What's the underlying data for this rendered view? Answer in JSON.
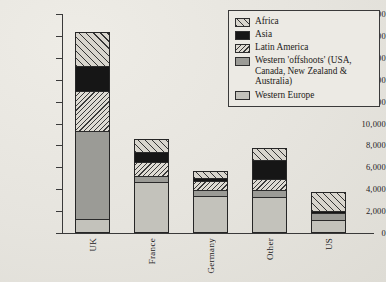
{
  "chart_data": {
    "type": "bar",
    "subtype": "stacked-vertical",
    "title": "",
    "xlabel": "",
    "ylabel": "",
    "ylim": [
      0,
      20000
    ],
    "ytick_step": 2000,
    "ytick_labels": [
      "20,000",
      "18,000",
      "16,000",
      "14,000",
      "12,000",
      "10,000",
      "8,000",
      "6,000",
      "4,000",
      "2,000",
      "0"
    ],
    "ytick_values": [
      20000,
      18000,
      16000,
      14000,
      12000,
      10000,
      8000,
      6000,
      4000,
      2000,
      0
    ],
    "grid": false,
    "legend_position": "top-right",
    "categories": [
      "UK",
      "France",
      "Germany",
      "Other",
      "US"
    ],
    "series": [
      {
        "name": "Western Europe",
        "fill": "solid-light-gray",
        "color": "#c3c2bb",
        "values": [
          1200,
          4700,
          3400,
          3300,
          1200
        ]
      },
      {
        "name": "Western 'offshoots'",
        "fill": "solid-mid-gray",
        "color": "#9b9b96",
        "values": [
          8100,
          500,
          550,
          600,
          600
        ]
      },
      {
        "name": "Latin America",
        "fill": "fine-hatch",
        "color": "#dedbd3",
        "values": [
          3700,
          1300,
          900,
          1100,
          0
        ]
      },
      {
        "name": "Asia",
        "fill": "solid-black",
        "color": "#161616",
        "values": [
          2300,
          1000,
          250,
          1700,
          200
        ]
      },
      {
        "name": "Africa",
        "fill": "coarse-hatch",
        "color": "#d8d5cd",
        "values": [
          3100,
          1100,
          600,
          1100,
          1700
        ]
      }
    ],
    "totals": [
      18400,
      8600,
      5700,
      7800,
      3700
    ],
    "stack_order_bottom_to_top": [
      "Western Europe",
      "Western 'offshoots'",
      "Latin America",
      "Asia",
      "Africa"
    ]
  },
  "legend": {
    "items": [
      {
        "label": "Africa",
        "swatch": "coarse-hatch-swatch"
      },
      {
        "label": "Asia",
        "swatch": "solid-black-swatch"
      },
      {
        "label": "Latin America",
        "swatch": "fine-hatch-swatch"
      },
      {
        "label": "Western 'offshoots' (USA, Canada, New Zealand & Australia)",
        "swatch": "solid-mid-gray-swatch"
      },
      {
        "label": "Western Europe",
        "swatch": "solid-light-gray-swatch"
      }
    ]
  }
}
